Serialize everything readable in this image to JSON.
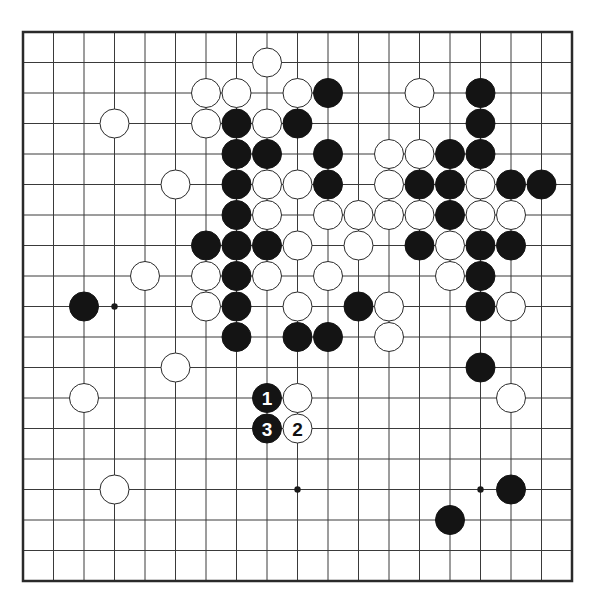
{
  "board": {
    "size": 19,
    "origin_x": 23,
    "origin_y": 32,
    "spacing": 30.5,
    "stone_radius": 14.5,
    "colors": {
      "line": "#3a3a3a",
      "black": "#141414",
      "white": "#ffffff",
      "background": "#ffffff"
    },
    "star_points": [
      [
        3,
        9
      ],
      [
        9,
        15
      ],
      [
        15,
        15
      ]
    ],
    "black_stones": [
      [
        10,
        2
      ],
      [
        15,
        2
      ],
      [
        7,
        3
      ],
      [
        9,
        3
      ],
      [
        15,
        3
      ],
      [
        7,
        4
      ],
      [
        8,
        4
      ],
      [
        10,
        4
      ],
      [
        14,
        4
      ],
      [
        15,
        4
      ],
      [
        7,
        5
      ],
      [
        10,
        5
      ],
      [
        13,
        5
      ],
      [
        14,
        5
      ],
      [
        16,
        5
      ],
      [
        17,
        5
      ],
      [
        7,
        6
      ],
      [
        14,
        6
      ],
      [
        6,
        7
      ],
      [
        7,
        7
      ],
      [
        8,
        7
      ],
      [
        13,
        7
      ],
      [
        15,
        7
      ],
      [
        16,
        7
      ],
      [
        7,
        8
      ],
      [
        15,
        8
      ],
      [
        2,
        9
      ],
      [
        7,
        9
      ],
      [
        11,
        9
      ],
      [
        15,
        9
      ],
      [
        7,
        10
      ],
      [
        9,
        10
      ],
      [
        10,
        10
      ],
      [
        15,
        11
      ],
      [
        16,
        15
      ],
      [
        14,
        16
      ]
    ],
    "white_stones": [
      [
        8,
        1
      ],
      [
        6,
        2
      ],
      [
        7,
        2
      ],
      [
        9,
        2
      ],
      [
        13,
        2
      ],
      [
        3,
        3
      ],
      [
        6,
        3
      ],
      [
        8,
        3
      ],
      [
        12,
        4
      ],
      [
        13,
        4
      ],
      [
        5,
        5
      ],
      [
        8,
        5
      ],
      [
        9,
        5
      ],
      [
        12,
        5
      ],
      [
        15,
        5
      ],
      [
        8,
        6
      ],
      [
        10,
        6
      ],
      [
        11,
        6
      ],
      [
        12,
        6
      ],
      [
        13,
        6
      ],
      [
        15,
        6
      ],
      [
        16,
        6
      ],
      [
        9,
        7
      ],
      [
        11,
        7
      ],
      [
        14,
        7
      ],
      [
        4,
        8
      ],
      [
        6,
        8
      ],
      [
        8,
        8
      ],
      [
        10,
        8
      ],
      [
        14,
        8
      ],
      [
        6,
        9
      ],
      [
        9,
        9
      ],
      [
        12,
        9
      ],
      [
        16,
        9
      ],
      [
        12,
        10
      ],
      [
        5,
        11
      ],
      [
        2,
        12
      ],
      [
        9,
        12
      ],
      [
        16,
        12
      ],
      [
        3,
        15
      ]
    ],
    "numbered_moves": [
      {
        "number": "1",
        "color": "black",
        "col": 8,
        "row": 12
      },
      {
        "number": "2",
        "color": "white",
        "col": 9,
        "row": 13
      },
      {
        "number": "3",
        "color": "black",
        "col": 8,
        "row": 13
      }
    ]
  }
}
